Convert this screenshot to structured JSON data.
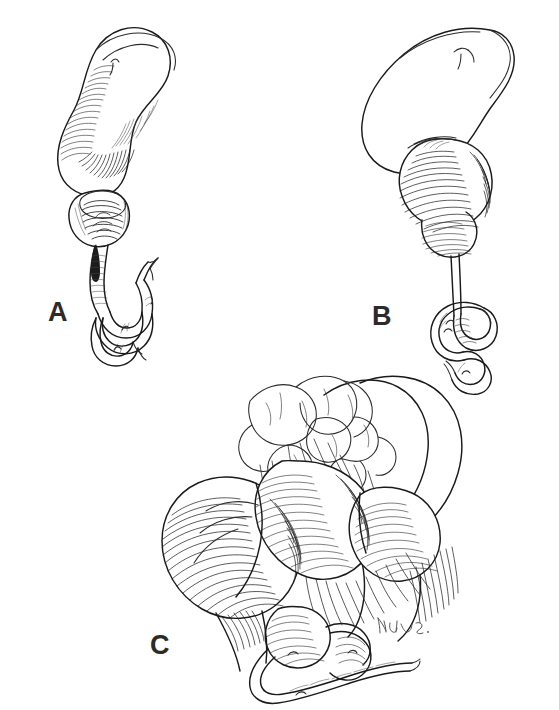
{
  "figure": {
    "background_color": "#ffffff",
    "ink_color": "#1a1a1a",
    "label_color": "#2b2b2b",
    "medium": "pen-and-ink line drawing with cross-hatch shading",
    "width": 559,
    "height": 710
  },
  "panels": [
    {
      "id": "A",
      "label": "A",
      "label_x": 48,
      "label_y": 299,
      "subject": "stomach with sigmoid curved body, dilated pylorus showing mucosal folds in cross-section, narrow efferent limb and coiled small bowel loop"
    },
    {
      "id": "B",
      "label": "B",
      "label_x": 372,
      "label_y": 303,
      "subject": "stomach with heavily hatched distended duodenal loop, long thin efferent limb descending to a coiled distal bowel segment"
    },
    {
      "id": "C",
      "label": "C",
      "label_x": 150,
      "label_y": 632,
      "subject": "close-up of markedly distended bowel loops with mesentery, vascular arcades and lobulated fat pads, coiled collapsed distal loops below"
    }
  ],
  "signature": {
    "text": "artist monogram",
    "x": 378,
    "y": 628,
    "color": "#555555"
  }
}
